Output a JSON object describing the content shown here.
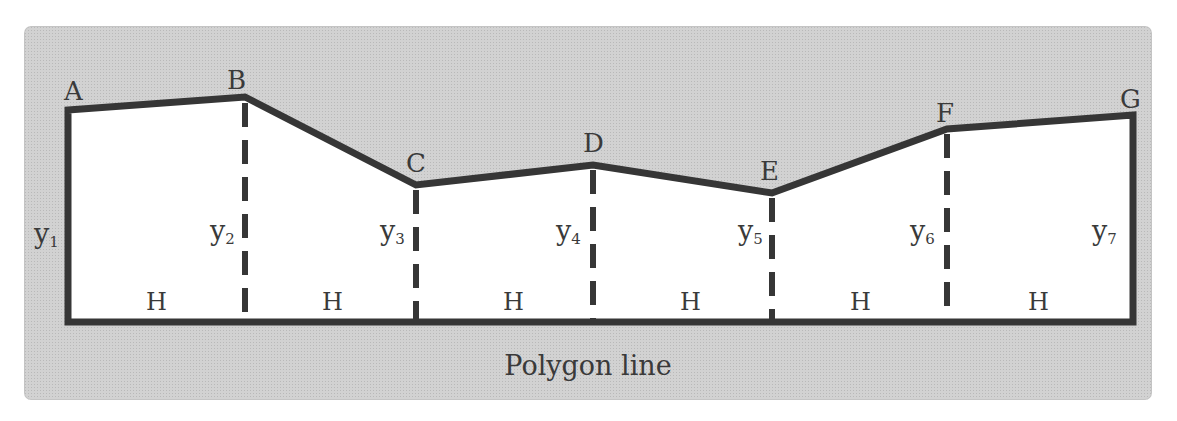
{
  "figure": {
    "caption": "Polygon line",
    "colors": {
      "panel_background": "#d2d2d2",
      "polygon_fill": "#ffffff",
      "outline": "#363636",
      "text": "#3a3a3a"
    },
    "points": [
      {
        "label": "A",
        "ordinate": "y",
        "sub": "1"
      },
      {
        "label": "B",
        "ordinate": "y",
        "sub": "2"
      },
      {
        "label": "C",
        "ordinate": "y",
        "sub": "3"
      },
      {
        "label": "D",
        "ordinate": "y",
        "sub": "4"
      },
      {
        "label": "E",
        "ordinate": "y",
        "sub": "5"
      },
      {
        "label": "F",
        "ordinate": "y",
        "sub": "6"
      },
      {
        "label": "G",
        "ordinate": "y",
        "sub": "7"
      }
    ],
    "spacing_labels": [
      "H",
      "H",
      "H",
      "H",
      "H",
      "H"
    ]
  }
}
